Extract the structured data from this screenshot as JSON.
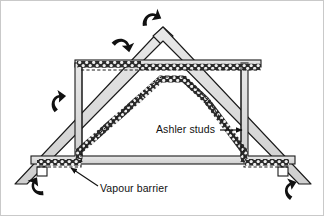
{
  "figure": {
    "kind": "construction-cross-section",
    "background_color": "#ffffff",
    "border_color": "#c9c9c9"
  },
  "labels": {
    "ashler_studs": "Ashler studs",
    "vapour_barrier": "Vapour barrier"
  },
  "colors": {
    "timber_fill": "#d5d5d5",
    "timber_fill_light": "#e4e4e4",
    "outline": "#1a1a1a",
    "insulation": "#2b2b2b",
    "arrow": "#111111",
    "leader": "#111111"
  },
  "callouts": [
    {
      "name": "ashler-studs",
      "text": "Ashler studs",
      "leader_from": [
        218,
        129
      ],
      "leader_to": [
        243,
        129
      ]
    },
    {
      "name": "vapour-barrier",
      "text": "Vapour barrier",
      "leader_from": [
        95,
        186
      ],
      "leader_to": [
        69,
        170
      ]
    }
  ],
  "airflow_arrows": [
    {
      "name": "ridge-vent-arrow",
      "x": 148,
      "y": 18,
      "rot": -22
    },
    {
      "name": "upper-slope-arrow",
      "x": 120,
      "y": 42,
      "rot": 18
    },
    {
      "name": "left-slope-arrow",
      "x": 57,
      "y": 103,
      "rot": -34
    },
    {
      "name": "left-eave-arrow",
      "x": 36,
      "y": 186,
      "rot": 8
    },
    {
      "name": "right-eave-arrow",
      "x": 285,
      "y": 188,
      "rot": -8
    }
  ],
  "structure": {
    "ridge_apex": [
      162,
      30
    ],
    "left_eave": [
      16,
      182
    ],
    "right_eave": [
      308,
      182
    ],
    "ceiling_tie_y": 63,
    "floor_tie_y": 158,
    "left_stud_x": 79,
    "right_stud_x": 243,
    "apex_triangle": {
      "peak": [
        162,
        30
      ],
      "left": [
        140,
        62
      ],
      "right": [
        184,
        62
      ]
    },
    "wall_plate_blocks": [
      [
        40,
        170
      ],
      [
        278,
        170
      ]
    ]
  }
}
